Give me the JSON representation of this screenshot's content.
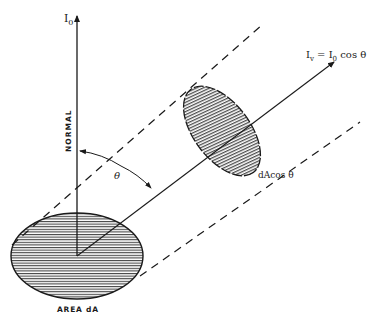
{
  "diagram": {
    "type": "physics-illustration",
    "labels": {
      "normal_intensity": "I",
      "normal_intensity_sub": "0",
      "normal_axis": "NORMAL",
      "angle": "θ",
      "viewed_intensity_lhs": "I",
      "viewed_intensity_lhs_sub": "v",
      "viewed_intensity_eq": " = I",
      "viewed_intensity_rhs_sub": "0",
      "viewed_intensity_rhs": " cos θ",
      "projected_area": "dAcos θ",
      "source_area": "AREA dA"
    },
    "elements": [
      {
        "id": "normal-arrow",
        "desc": "vertical arrow from area center labeled I0"
      },
      {
        "id": "view-arrow",
        "desc": "oblique arrow at angle theta from normal labeled Iv = I0 cos theta"
      },
      {
        "id": "source-ellipse",
        "desc": "horizontally hatched ellipse representing area dA"
      },
      {
        "id": "projected-ellipse",
        "desc": "vertically hatched tilted ellipse representing dA cos theta"
      },
      {
        "id": "dashed-tube",
        "desc": "two parallel dashed lines bounding the projection"
      },
      {
        "id": "angle-arc",
        "desc": "arc with arrowheads between normal and viewing direction"
      }
    ],
    "colors": {
      "ink": "#1a1a1a",
      "background": "#ffffff"
    }
  }
}
